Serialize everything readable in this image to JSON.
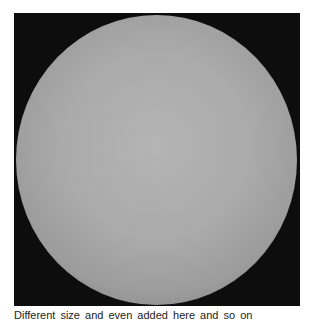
{
  "figure": {
    "background_color": "#0d0d0d",
    "sphere_color": "#aaaaaa"
  },
  "caption": {
    "text": "Different size and even            added here and so on"
  }
}
